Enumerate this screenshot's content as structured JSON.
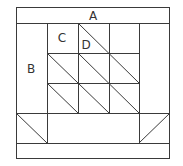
{
  "diagram": {
    "labels": {
      "A": "A",
      "B": "B",
      "C": "C",
      "D": "D"
    },
    "colors": {
      "line": "#3a3a3a",
      "background": "#ffffff",
      "text": "#333333"
    }
  }
}
